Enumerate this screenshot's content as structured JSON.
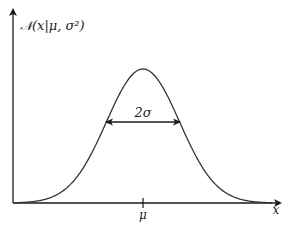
{
  "diagram": {
    "y_axis_label": "𝒩(x|μ, σ²)",
    "x_axis_label": "x",
    "mean_tick_label": "μ",
    "width_annotation": "2σ",
    "colors": {
      "curve": "#333333",
      "axes": "#1a1a1a",
      "text": "#222222",
      "background": "#ffffff"
    },
    "geometry": {
      "origin": [
        13,
        203
      ],
      "x_axis_end": [
        282,
        203
      ],
      "y_axis_end": [
        13,
        8
      ],
      "mean_x": 143,
      "peak_y": 69,
      "sigma_px": 36.5,
      "sigma_arrow_y": 122
    }
  }
}
